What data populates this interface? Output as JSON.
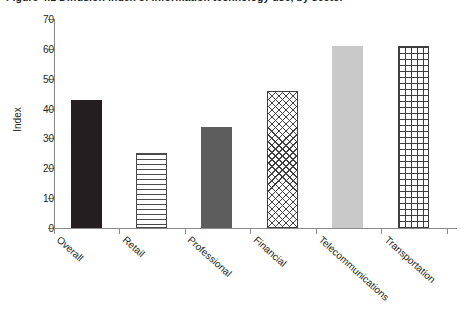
{
  "figure": {
    "title": "Figure 4.1  Diffusion index of information technology use, by sector",
    "title_cropped": true
  },
  "axes": {
    "y_title": "Index",
    "y_ticks": [
      "0",
      "10",
      "20",
      "30",
      "40",
      "50",
      "60",
      "70"
    ]
  },
  "chart_data": {
    "type": "bar",
    "title": "Figure 4.1  Diffusion index of information technology use, by sector",
    "xlabel": "",
    "ylabel": "Index",
    "ylim": [
      0,
      70
    ],
    "ytick_step": 10,
    "grid": false,
    "legend": null,
    "categories": [
      "Overall",
      "Retail",
      "Professional",
      "Financial",
      "Telecommunications",
      "Transportation"
    ],
    "values": [
      43,
      25,
      34,
      46,
      61,
      61
    ],
    "bar_styles": [
      "solid-dark",
      "horizontal-stripes",
      "solid-mid-gray",
      "cross-hatch",
      "solid-light-gray",
      "grid"
    ],
    "colors": {
      "solid_dark": "#231f20",
      "solid_mid_gray": "#5d5d5d",
      "solid_light_gray": "#c9c9c9",
      "pattern_line": "#3f3f3f",
      "axis": "#8a8a8a",
      "text": "#231f20",
      "background": "#ffffff"
    }
  }
}
